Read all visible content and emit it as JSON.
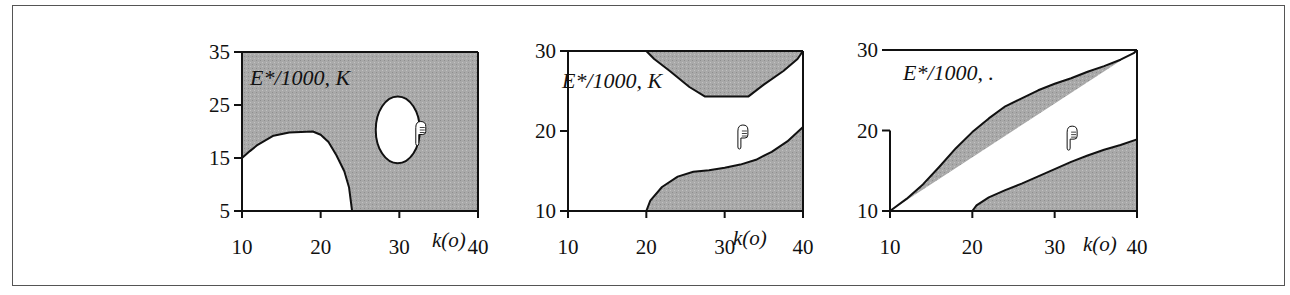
{
  "figure": {
    "frame": true,
    "shade_color": "#a9a9a9",
    "line_color": "#111111"
  },
  "chart_data": [
    {
      "type": "area",
      "title": "E*/1000, K",
      "xlabel": "k(o)",
      "ylabel": "",
      "xlim": [
        10,
        40
      ],
      "ylim": [
        5,
        35
      ],
      "xticks": [
        "10",
        "20",
        "30",
        "40"
      ],
      "yticks": [
        "35",
        "25",
        "15",
        "5"
      ],
      "grid": false,
      "background": "shaded",
      "regions": [
        {
          "name": "unshaded-lower-left",
          "fill": "white",
          "boundary": [
            [
              10,
              5
            ],
            [
              10,
              15
            ],
            [
              11,
              16.3
            ],
            [
              12,
              17.5
            ],
            [
              14,
              19.2
            ],
            [
              16,
              19.8
            ],
            [
              19,
              20
            ],
            [
              20,
              19.4
            ],
            [
              21,
              18
            ],
            [
              22,
              15.5
            ],
            [
              23,
              12.5
            ],
            [
              23.6,
              9.5
            ],
            [
              24,
              5
            ]
          ]
        },
        {
          "name": "unshaded-ellipse",
          "fill": "white",
          "shape": "ellipse",
          "center": [
            29.8,
            20.3
          ],
          "rx": 2.8,
          "ry": 6.3
        }
      ],
      "marker": {
        "type": "pointing-hand",
        "at": [
          32.6,
          20
        ]
      }
    },
    {
      "type": "area",
      "title": "E*/1000, K",
      "xlabel": "k(o)",
      "ylabel": "",
      "xlim": [
        10,
        40
      ],
      "ylim": [
        10,
        30
      ],
      "xticks": [
        "10",
        "20",
        "30",
        "40"
      ],
      "yticks": [
        "30",
        "20",
        "10"
      ],
      "grid": false,
      "background": "white",
      "regions": [
        {
          "name": "shaded-top",
          "fill": "shaded",
          "boundary": [
            [
              20,
              30
            ],
            [
              21,
              29
            ],
            [
              23,
              27.5
            ],
            [
              25.5,
              25.5
            ],
            [
              27.5,
              24.3
            ],
            [
              33,
              24.3
            ],
            [
              35,
              25.8
            ],
            [
              37.5,
              27.5
            ],
            [
              39.3,
              29
            ],
            [
              40,
              30
            ]
          ]
        },
        {
          "name": "shaded-bottom-right",
          "fill": "shaded",
          "boundary": [
            [
              20,
              10
            ],
            [
              20.5,
              11.3
            ],
            [
              22,
              13
            ],
            [
              24,
              14.3
            ],
            [
              26,
              14.9
            ],
            [
              28,
              15.1
            ],
            [
              30,
              15.4
            ],
            [
              32,
              15.8
            ],
            [
              34,
              16.4
            ],
            [
              36,
              17.4
            ],
            [
              38,
              18.7
            ],
            [
              40,
              20.5
            ],
            [
              40,
              10
            ]
          ]
        }
      ],
      "marker": {
        "type": "pointing-hand",
        "at": [
          32.2,
          19.5
        ]
      }
    },
    {
      "type": "area",
      "title": "E*/1000, .",
      "xlabel": "k(o)",
      "ylabel": "",
      "xlim": [
        10,
        40
      ],
      "ylim": [
        10,
        30
      ],
      "xticks": [
        "10",
        "20",
        "30",
        "40"
      ],
      "yticks": [
        "30",
        "20",
        "10"
      ],
      "grid": false,
      "background": "white",
      "regions": [
        {
          "name": "shaded-upper-left",
          "fill": "shaded",
          "boundary": [
            [
              10,
              10
            ],
            [
              12,
              11.5
            ],
            [
              14,
              13.3
            ],
            [
              16,
              15.5
            ],
            [
              18,
              17.8
            ],
            [
              20,
              19.8
            ],
            [
              22,
              21.5
            ],
            [
              24,
              23
            ],
            [
              26,
              24
            ],
            [
              28,
              25
            ],
            [
              30,
              25.8
            ],
            [
              32,
              26.5
            ],
            [
              34,
              27.3
            ],
            [
              36,
              28
            ],
            [
              38,
              28.8
            ],
            [
              39.6,
              29.6
            ],
            [
              40,
              30
            ]
          ]
        },
        {
          "name": "shaded-bottom-right",
          "fill": "shaded",
          "boundary": [
            [
              20,
              10
            ],
            [
              20.5,
              10.7
            ],
            [
              22,
              11.7
            ],
            [
              24,
              12.6
            ],
            [
              26,
              13.4
            ],
            [
              28,
              14.3
            ],
            [
              30,
              15.2
            ],
            [
              32,
              16.1
            ],
            [
              34,
              16.9
            ],
            [
              36,
              17.6
            ],
            [
              38,
              18.2
            ],
            [
              40,
              18.9
            ],
            [
              40,
              10
            ]
          ]
        }
      ],
      "marker": {
        "type": "pointing-hand",
        "at": [
          32.0,
          19.3
        ]
      }
    }
  ],
  "panels_layout": [
    {
      "x0": 242,
      "x1": 478,
      "y0": 52,
      "y1": 211,
      "title_pos": [
        250,
        85
      ],
      "xlabel_pos": [
        432,
        247
      ],
      "left_axis_from": 35
    },
    {
      "x0": 568,
      "x1": 803,
      "y0": 51,
      "y1": 211,
      "title_pos": [
        562,
        88
      ],
      "xlabel_pos": [
        733,
        245
      ],
      "left_axis_from": 30
    },
    {
      "x0": 890,
      "x1": 1137,
      "y0": 50,
      "y1": 211,
      "title_pos": [
        903,
        80
      ],
      "xlabel_pos": [
        1083,
        251
      ],
      "left_axis_from": 20
    }
  ]
}
